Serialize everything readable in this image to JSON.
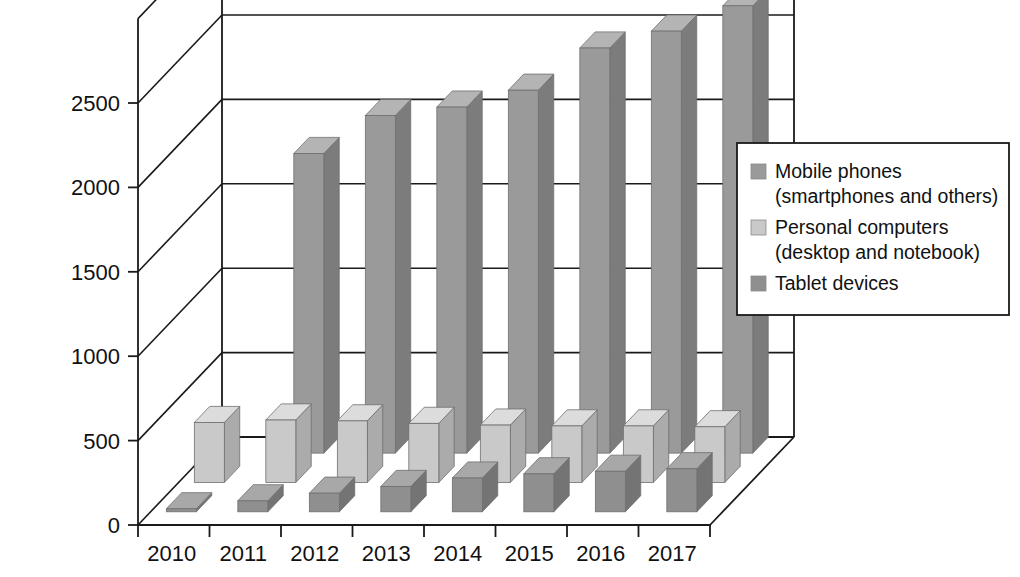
{
  "chart_data": {
    "type": "bar",
    "style": "3d-grouped-depth",
    "title": "",
    "subtitle": "",
    "xlabel": "",
    "ylabel": "",
    "categories": [
      "2010",
      "2011",
      "2012",
      "2013",
      "2014",
      "2015",
      "2016",
      "2017"
    ],
    "series": [
      {
        "name": "Mobile phones (smartphones and others)",
        "color": "#9a9a9a",
        "values": [
          0,
          1775,
          2000,
          2050,
          2150,
          2400,
          2500,
          2650
        ]
      },
      {
        "name": "Personal computers (desktop and notebook)",
        "color": "#c9c9c9",
        "values": [
          355,
          370,
          365,
          350,
          340,
          335,
          335,
          330
        ]
      },
      {
        "name": "Tablet devices",
        "color": "#8f8f8f",
        "values": [
          18,
          65,
          110,
          150,
          200,
          225,
          240,
          255
        ]
      }
    ],
    "ylim": [
      0,
      3000
    ],
    "yticks": [
      "0",
      "500",
      "1000",
      "1500",
      "2000",
      "2500"
    ],
    "ytick_values": [
      0,
      500,
      1000,
      1500,
      2000,
      2500
    ],
    "grid": true,
    "legend_position": "right"
  },
  "legend": {
    "items": [
      {
        "label_line1": "Mobile phones",
        "label_line2": "(smartphones and others)",
        "swatch": "#9a9a9a"
      },
      {
        "label_line1": "Personal computers",
        "label_line2": "(desktop and notebook)",
        "swatch": "#c9c9c9"
      },
      {
        "label_line1": "Tablet devices",
        "label_line2": "",
        "swatch": "#8f8f8f"
      }
    ]
  },
  "colors": {
    "axis": "#1a1a1a",
    "background": "#ffffff",
    "mobile_face": "#9a9a9a",
    "mobile_side": "#7c7c7c",
    "mobile_top": "#b4b4b4",
    "pc_face": "#c9c9c9",
    "pc_side": "#ababab",
    "pc_top": "#dcdcdc",
    "tablet_face": "#8f8f8f",
    "tablet_side": "#747474",
    "tablet_top": "#a8a8a8"
  }
}
